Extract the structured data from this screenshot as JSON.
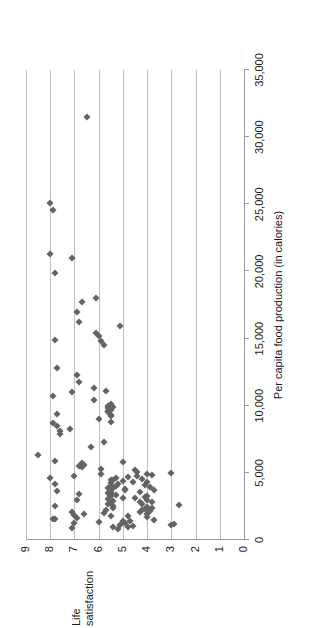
{
  "chart_data": {
    "type": "scatter",
    "title": "",
    "xlabel": "Per capita food production (in calories)",
    "ylabel_line1": "Life",
    "ylabel_line2": "satisfaction",
    "ylabel": "Life satisfaction",
    "xlim": [
      0,
      35000
    ],
    "ylim": [
      0,
      9
    ],
    "xticks": [
      0,
      5000,
      10000,
      15000,
      20000,
      25000,
      30000,
      35000
    ],
    "xtick_labels": [
      "0",
      "5,000",
      "10,000",
      "15,000",
      "20,000",
      "25,000",
      "30,000",
      "35,000"
    ],
    "yticks": [
      0,
      1,
      2,
      3,
      4,
      5,
      6,
      7,
      8,
      9
    ],
    "ytick_labels": [
      "0",
      "1",
      "2",
      "3",
      "4",
      "5",
      "6",
      "7",
      "8",
      "9"
    ],
    "grid": "horizontal",
    "grid_color": "#bfbfbf",
    "marker": "diamond",
    "marker_color": "#636363",
    "marker_size": 5,
    "legend": "none",
    "rotation_degrees": -90,
    "points": [
      [
        31500,
        6.5
      ],
      [
        25100,
        8.0
      ],
      [
        24600,
        7.9
      ],
      [
        21300,
        8.0
      ],
      [
        21000,
        7.1
      ],
      [
        19900,
        7.8
      ],
      [
        18000,
        6.1
      ],
      [
        17700,
        6.7
      ],
      [
        17000,
        6.9
      ],
      [
        16200,
        6.8
      ],
      [
        15900,
        5.1
      ],
      [
        15400,
        6.1
      ],
      [
        15200,
        6.0
      ],
      [
        14900,
        7.8
      ],
      [
        14800,
        5.9
      ],
      [
        14500,
        5.8
      ],
      [
        12800,
        7.7
      ],
      [
        12300,
        6.9
      ],
      [
        11800,
        6.8
      ],
      [
        11300,
        6.2
      ],
      [
        11100,
        5.7
      ],
      [
        11000,
        7.1
      ],
      [
        10700,
        7.9
      ],
      [
        10400,
        6.2
      ],
      [
        10100,
        5.5
      ],
      [
        10000,
        5.6
      ],
      [
        9900,
        5.4
      ],
      [
        9800,
        5.6
      ],
      [
        9700,
        5.5
      ],
      [
        9600,
        5.6
      ],
      [
        9500,
        5.6
      ],
      [
        9400,
        7.7
      ],
      [
        9300,
        5.5
      ],
      [
        9200,
        5.5
      ],
      [
        9000,
        6.0
      ],
      [
        8800,
        5.5
      ],
      [
        8700,
        7.9
      ],
      [
        8500,
        7.7
      ],
      [
        8300,
        7.2
      ],
      [
        8100,
        7.6
      ],
      [
        7900,
        7.6
      ],
      [
        7300,
        5.8
      ],
      [
        6900,
        6.3
      ],
      [
        6300,
        8.5
      ],
      [
        5900,
        7.8
      ],
      [
        5800,
        5.0
      ],
      [
        5700,
        6.7
      ],
      [
        5600,
        6.6
      ],
      [
        5500,
        6.8
      ],
      [
        5400,
        6.7
      ],
      [
        5300,
        5.9
      ],
      [
        5200,
        4.5
      ],
      [
        5100,
        4.4
      ],
      [
        5000,
        3.0
      ],
      [
        4950,
        4.0
      ],
      [
        4900,
        5.9
      ],
      [
        4850,
        3.8
      ],
      [
        4800,
        4.4
      ],
      [
        4750,
        7.0
      ],
      [
        4700,
        4.8
      ],
      [
        4650,
        5.3
      ],
      [
        4600,
        8.0
      ],
      [
        4550,
        4.2
      ],
      [
        4500,
        5.5
      ],
      [
        4450,
        5.4
      ],
      [
        4400,
        5.0
      ],
      [
        4350,
        4.6
      ],
      [
        4300,
        4.0
      ],
      [
        4250,
        5.5
      ],
      [
        4200,
        7.8
      ],
      [
        4150,
        5.2
      ],
      [
        4100,
        4.1
      ],
      [
        4050,
        5.3
      ],
      [
        4000,
        5.5
      ],
      [
        3950,
        3.9
      ],
      [
        3900,
        5.4
      ],
      [
        3850,
        5.6
      ],
      [
        3800,
        4.9
      ],
      [
        3750,
        3.7
      ],
      [
        3700,
        4.9
      ],
      [
        3650,
        7.7
      ],
      [
        3600,
        5.5
      ],
      [
        3550,
        4.3
      ],
      [
        3500,
        5.6
      ],
      [
        3450,
        6.8
      ],
      [
        3400,
        5.5
      ],
      [
        3350,
        5.3
      ],
      [
        3300,
        4.0
      ],
      [
        3250,
        5.5
      ],
      [
        3200,
        4.1
      ],
      [
        3150,
        5.0
      ],
      [
        3100,
        4.5
      ],
      [
        3050,
        5.6
      ],
      [
        3000,
        6.9
      ],
      [
        2950,
        4.0
      ],
      [
        2900,
        5.4
      ],
      [
        2850,
        3.8
      ],
      [
        2800,
        4.3
      ],
      [
        2750,
        5.5
      ],
      [
        2700,
        4.2
      ],
      [
        2650,
        5.6
      ],
      [
        2600,
        2.7
      ],
      [
        2550,
        5.4
      ],
      [
        2500,
        7.8
      ],
      [
        2450,
        4.0
      ],
      [
        2400,
        3.8
      ],
      [
        2350,
        5.4
      ],
      [
        2300,
        4.1
      ],
      [
        2250,
        4.2
      ],
      [
        2200,
        5.7
      ],
      [
        2150,
        3.9
      ],
      [
        2100,
        7.1
      ],
      [
        2050,
        4.3
      ],
      [
        2000,
        5.8
      ],
      [
        1950,
        6.6
      ],
      [
        1900,
        4.0
      ],
      [
        1850,
        7.0
      ],
      [
        1800,
        5.5
      ],
      [
        1750,
        4.8
      ],
      [
        1700,
        4.0
      ],
      [
        1650,
        6.9
      ],
      [
        1600,
        7.8
      ],
      [
        1550,
        7.9
      ],
      [
        1500,
        3.7
      ],
      [
        1450,
        5.0
      ],
      [
        1400,
        4.7
      ],
      [
        1350,
        6.0
      ],
      [
        1300,
        4.9
      ],
      [
        1250,
        7.0
      ],
      [
        1200,
        2.9
      ],
      [
        1150,
        3.0
      ],
      [
        1100,
        5.1
      ],
      [
        1050,
        4.6
      ],
      [
        1000,
        4.8
      ],
      [
        950,
        5.4
      ],
      [
        900,
        7.1
      ],
      [
        850,
        5.2
      ]
    ]
  }
}
